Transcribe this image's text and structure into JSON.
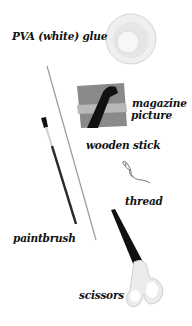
{
  "labels": {
    "glue": "PVA (white) glue",
    "magazine_line1": "magazine",
    "magazine_line2": "picture",
    "stick": "wooden stick",
    "thread": "thread",
    "paintbrush": "paintbrush",
    "scissors": "scissors"
  },
  "colors": {
    "background": "#ffffff",
    "text": "#111111",
    "scissor_blade": "#111111",
    "scissor_handle": "#e8e8e8",
    "glue_dish": "#e4e4e4"
  }
}
